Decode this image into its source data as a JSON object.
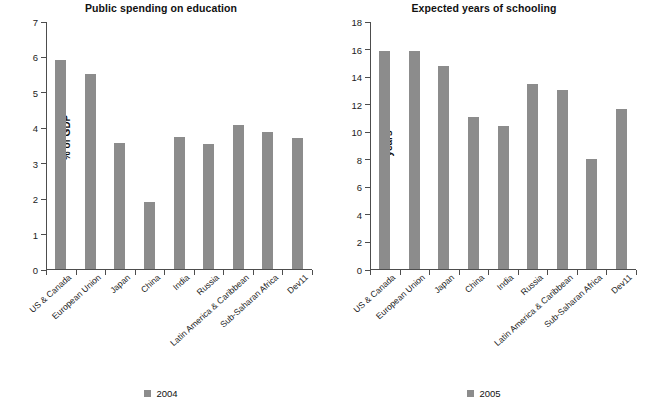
{
  "figure": {
    "background": "#ffffff",
    "bar_color": "#8c8c8c",
    "axis_color": "#4d4d4d"
  },
  "panels": [
    {
      "id": "public-spending-on-education",
      "title": "Public spending on education",
      "ylabel": "% of GDP",
      "legend_label": "2004"
    },
    {
      "id": "expected-years-of-schooling",
      "title": "Expected years of schooling",
      "ylabel": "years",
      "legend_label": "2005"
    }
  ],
  "chart_data": [
    {
      "type": "bar",
      "title": "Public spending on education",
      "xlabel": "",
      "ylabel": "% of GDP",
      "ylim": [
        0,
        7
      ],
      "yticks": [
        0,
        1,
        2,
        3,
        4,
        5,
        6,
        7
      ],
      "grid": false,
      "legend": "2004",
      "legend_position": "bottom-center",
      "categories": [
        "US & Canada",
        "European Union",
        "Japan",
        "China",
        "India",
        "Russia",
        "Latin America & Caribbean",
        "Sub-Saharan Africa",
        "Dev11"
      ],
      "values": [
        5.9,
        5.5,
        3.57,
        1.89,
        3.73,
        3.52,
        4.06,
        3.88,
        3.69
      ]
    },
    {
      "type": "bar",
      "title": "Expected years of schooling",
      "xlabel": "",
      "ylabel": "years",
      "ylim": [
        0,
        18
      ],
      "yticks": [
        0,
        2,
        4,
        6,
        8,
        10,
        12,
        14,
        16,
        18
      ],
      "grid": false,
      "legend": "2005",
      "legend_position": "bottom-center",
      "categories": [
        "US & Canada",
        "European Union",
        "Japan",
        "China",
        "India",
        "Russia",
        "Latin America & Caribbean",
        "Sub-Saharan Africa",
        "Dev11"
      ],
      "values": [
        15.8,
        15.82,
        14.75,
        11.05,
        10.4,
        13.45,
        13.0,
        7.95,
        11.6
      ]
    }
  ]
}
